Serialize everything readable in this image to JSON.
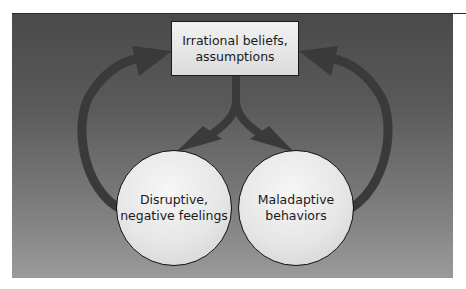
{
  "diagram": {
    "type": "cycle",
    "nodes": {
      "top": {
        "line1": "Irrational beliefs,",
        "line2": "assumptions"
      },
      "left": {
        "line1": "Disruptive,",
        "line2": "negative feelings"
      },
      "right": {
        "line1": "Maladaptive",
        "line2": "behaviors"
      }
    },
    "edges": [
      {
        "from": "top",
        "to": "left"
      },
      {
        "from": "top",
        "to": "right"
      },
      {
        "from": "left",
        "to": "top"
      },
      {
        "from": "right",
        "to": "top"
      }
    ],
    "colors": {
      "arrow": "#3a3a3a",
      "panel_top": "#4a4a4a",
      "panel_bottom": "#9a9a9a",
      "node_fill": "#e8e8e8",
      "node_border": "#111111"
    }
  }
}
